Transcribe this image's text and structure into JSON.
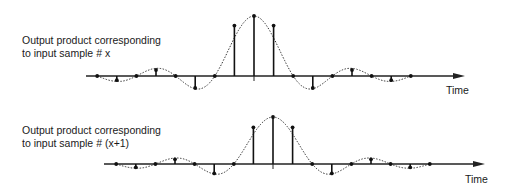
{
  "diagram": {
    "panels": [
      {
        "label_line1": "Output product corresponding",
        "label_line2": "to input sample # x",
        "axis_label": "Time",
        "axis_y": 76,
        "axis_x_start": 86,
        "axis_x_end": 465,
        "peak_x": 254,
        "spacing": 19.6,
        "samples": [
          0,
          -0.07,
          0,
          0.1,
          0,
          -0.2,
          0,
          0.84,
          1.0,
          0.84,
          0,
          -0.2,
          0,
          0.1,
          0,
          -0.07,
          0
        ],
        "amplitude_px": 60
      },
      {
        "label_line1": "Output product corresponding",
        "label_line2": "to input sample # (x+1)",
        "axis_label": "Time",
        "axis_y": 164,
        "axis_x_start": 104,
        "axis_x_end": 485,
        "peak_x": 273,
        "spacing": 19.6,
        "samples": [
          0,
          -0.07,
          0,
          0.1,
          0,
          -0.2,
          0,
          0.78,
          1.0,
          0.78,
          0,
          -0.2,
          0,
          0.1,
          0,
          -0.07,
          0
        ],
        "amplitude_px": 47
      }
    ]
  }
}
